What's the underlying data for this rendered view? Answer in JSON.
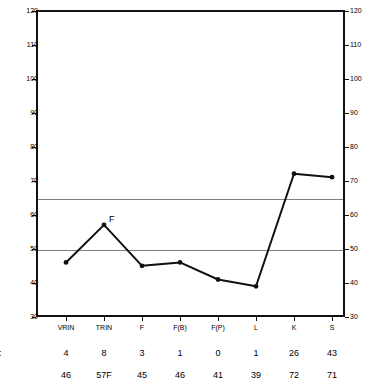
{
  "chart_data": {
    "type": "line",
    "title": "",
    "subtitle": "",
    "xlabel": "",
    "ylabel": "",
    "ylim": [
      30,
      120
    ],
    "ytick_step": 10,
    "yticks": [
      30,
      40,
      50,
      60,
      70,
      80,
      90,
      100,
      110,
      120
    ],
    "grid": false,
    "legend": "none",
    "dual_y_axis": true,
    "categories": [
      "VRIN",
      "TRIN",
      "F",
      "F(B)",
      "F(P)",
      "L",
      "K",
      "S"
    ],
    "series": [
      {
        "name": "T Score",
        "values": [
          46,
          57,
          45,
          46,
          41,
          39,
          72,
          71
        ]
      }
    ],
    "reference_lines": [
      {
        "value": 65,
        "color": "#808080"
      },
      {
        "value": 50,
        "color": "#808080"
      }
    ],
    "annotations": [
      {
        "category": "TRIN",
        "value": 57,
        "text": "F"
      }
    ]
  },
  "axis": {
    "left_ticks": [
      "120",
      "110",
      "100",
      "90",
      "80",
      "70",
      "60",
      "50",
      "40",
      "30"
    ],
    "right_ticks": [
      "120",
      "110",
      "100",
      "90",
      "80",
      "70",
      "60",
      "50",
      "40",
      "30"
    ]
  },
  "categories": [
    "VRIN",
    "TRIN",
    "F",
    "F(B)",
    "F(P)",
    "L",
    "K",
    "S"
  ],
  "table": {
    "rows": [
      {
        "label": "ore:",
        "name": "raw-score",
        "values": [
          "4",
          "8",
          "3",
          "1",
          "0",
          "1",
          "26",
          "43"
        ]
      },
      {
        "label": ":",
        "name": "t-score",
        "values": [
          "46",
          "57F",
          "45",
          "46",
          "41",
          "39",
          "72",
          "71"
        ]
      }
    ]
  },
  "colors": {
    "series": "#111111",
    "reference_line": "#808080",
    "frame": "#111111",
    "background": "#ffffff"
  }
}
